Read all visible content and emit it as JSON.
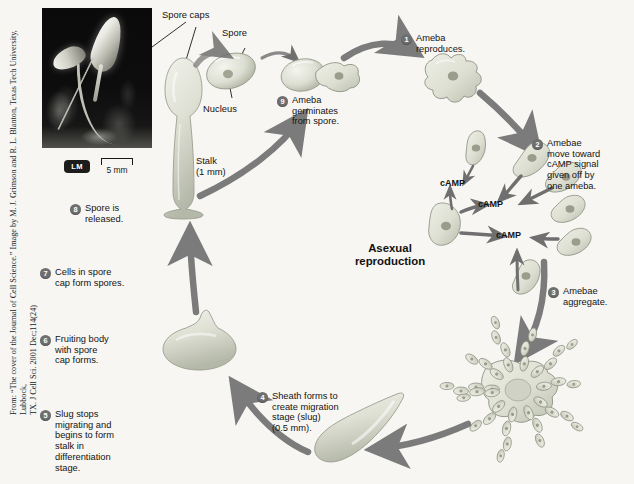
{
  "figure": {
    "center_title": "Asexual\nreproduction",
    "credit": "From: “The cover of the Journal of Cell Science.” Image by M. J. Grimson and R. L. Blanton, Texas Tech University, Lubbock,\nTX. J Cell Sci. 2001 Dec;114(24)"
  },
  "photo": {
    "magnification_badge": "LM",
    "scale_label": "5 mm"
  },
  "labels": [
    {
      "id": "spore-caps",
      "text": "Spore caps"
    },
    {
      "id": "spore",
      "text": "Spore"
    },
    {
      "id": "nucleus",
      "text": "Nucleus"
    },
    {
      "id": "stalk",
      "text": "Stalk\n(1 mm)"
    }
  ],
  "signal_labels": [
    {
      "id": "camp-1",
      "text": "cAMP"
    },
    {
      "id": "camp-2",
      "text": "cAMP"
    },
    {
      "id": "camp-3",
      "text": "cAMP"
    }
  ],
  "steps": [
    {
      "number": "1",
      "text": "Ameba\nreproduces."
    },
    {
      "number": "2",
      "text": "Amebae\nmove toward\ncAMP signal\ngiven off by\none ameba."
    },
    {
      "number": "3",
      "text": "Amebae\naggregate."
    },
    {
      "number": "4",
      "text": "Sheath forms to\ncreate migration\nstage (slug)\n(0.5 mm)."
    },
    {
      "number": "5",
      "text": "Slug stops\nmigrating and\nbegins to form\nstalk in\ndifferentiation\nstage."
    },
    {
      "number": "6",
      "text": "Fruiting body\nwith spore\ncap forms."
    },
    {
      "number": "7",
      "text": "Cells in spore\ncap form spores."
    },
    {
      "number": "8",
      "text": "Spore is\nreleased."
    },
    {
      "number": "9",
      "text": "Ameba\ngerminates\nfrom spore."
    }
  ],
  "colors": {
    "background": "#f7f6f2",
    "arrow": "#7b7b7b",
    "step_badge": "#6f6f6f",
    "cell_fill": "#d9dbcf",
    "cell_stroke": "#8d9082",
    "nucleus": "#9a9c8c",
    "text": "#141414"
  }
}
